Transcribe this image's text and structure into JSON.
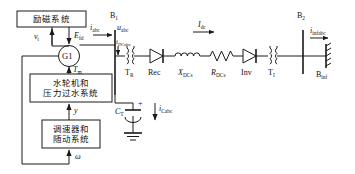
{
  "diagram": {
    "blocks": [
      {
        "id": "excitation",
        "label": "励磁系统"
      },
      {
        "id": "turbine",
        "label_line1": "水轮机和",
        "label_line2": "压力过水系统"
      },
      {
        "id": "governor",
        "label_line1": "调速器和",
        "label_line2": "随动系统"
      }
    ],
    "generator": {
      "label": "G1"
    },
    "signals": {
      "vt": {
        "base": "v",
        "sub": "t"
      },
      "efd": {
        "base": "E",
        "sub": "fd"
      },
      "tm": {
        "base": "T",
        "sub": "m"
      },
      "y": {
        "base": "y",
        "sub": ""
      },
      "omega": {
        "base": "ω",
        "sub": ""
      },
      "iabc": {
        "base": "i",
        "sub": "abc"
      },
      "uabc": {
        "base": "u",
        "sub": "abc"
      },
      "idcabc": {
        "base": "i",
        "sub": "DCabc"
      },
      "icabc": {
        "base": "i",
        "sub": "Cabc"
      },
      "idc": {
        "base": "I",
        "sub": "dc"
      },
      "iinfabc": {
        "base": "i",
        "sub": "infabc"
      }
    },
    "devices": {
      "bus1": {
        "base": "B",
        "sub": "1"
      },
      "bus2": {
        "base": "B",
        "sub": "2"
      },
      "binf": {
        "base": "B",
        "sub": "inf"
      },
      "tr": {
        "base": "T",
        "sub": "R"
      },
      "ti": {
        "base": "T",
        "sub": "I"
      },
      "rec": {
        "base": "Rec",
        "sub": ""
      },
      "inv": {
        "base": "Inv",
        "sub": ""
      },
      "ct": {
        "base": "C",
        "sub": "T"
      },
      "xdcs": {
        "base": "X",
        "sub": "DCs"
      },
      "rdcs": {
        "base": "R",
        "sub": "DCs"
      },
      "plus": {
        "base": "+",
        "sub": ""
      }
    },
    "colors": {
      "line": "#1a1a1a",
      "background": "#ffffff"
    }
  }
}
